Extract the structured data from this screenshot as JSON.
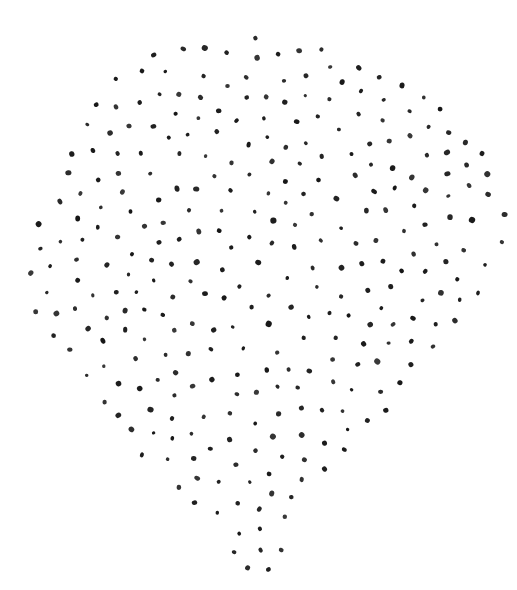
{
  "figure": {
    "background_color": "#ffffff",
    "dot_color": "#161616",
    "canvas": {
      "width": 517,
      "height": 590
    },
    "stipple": {
      "seed": 911,
      "min_spacing": 19,
      "dot_radius_min": 1.8,
      "dot_radius_max": 2.7,
      "edge_margin": 3,
      "max_attempts": 40000,
      "max_dots": 420,
      "dot_opacity_min": 0.86,
      "dot_opacity_max": 1.0,
      "blur_std_dev": 0.4
    },
    "outline": [
      [
        245,
        32
      ],
      [
        278,
        35
      ],
      [
        308,
        42
      ],
      [
        332,
        48
      ],
      [
        354,
        56
      ],
      [
        374,
        66
      ],
      [
        394,
        77
      ],
      [
        414,
        87
      ],
      [
        434,
        99
      ],
      [
        452,
        111
      ],
      [
        466,
        125
      ],
      [
        479,
        141
      ],
      [
        491,
        159
      ],
      [
        501,
        181
      ],
      [
        508,
        206
      ],
      [
        511,
        233
      ],
      [
        507,
        259
      ],
      [
        497,
        282
      ],
      [
        483,
        306
      ],
      [
        467,
        329
      ],
      [
        449,
        349
      ],
      [
        429,
        369
      ],
      [
        409,
        389
      ],
      [
        391,
        409
      ],
      [
        375,
        429
      ],
      [
        357,
        445
      ],
      [
        341,
        456
      ],
      [
        329,
        471
      ],
      [
        317,
        489
      ],
      [
        305,
        506
      ],
      [
        297,
        526
      ],
      [
        289,
        546
      ],
      [
        279,
        563
      ],
      [
        267,
        579
      ],
      [
        255,
        587
      ],
      [
        245,
        580
      ],
      [
        237,
        566
      ],
      [
        227,
        549
      ],
      [
        214,
        533
      ],
      [
        199,
        519
      ],
      [
        183,
        503
      ],
      [
        165,
        485
      ],
      [
        147,
        467
      ],
      [
        129,
        449
      ],
      [
        111,
        429
      ],
      [
        95,
        411
      ],
      [
        79,
        391
      ],
      [
        63,
        369
      ],
      [
        49,
        346
      ],
      [
        37,
        323
      ],
      [
        28,
        301
      ],
      [
        25,
        279
      ],
      [
        27,
        256
      ],
      [
        32,
        233
      ],
      [
        39,
        209
      ],
      [
        49,
        183
      ],
      [
        61,
        158
      ],
      [
        70,
        133
      ],
      [
        82,
        110
      ],
      [
        96,
        88
      ],
      [
        112,
        73
      ],
      [
        130,
        62
      ],
      [
        152,
        51
      ],
      [
        182,
        43
      ],
      [
        214,
        36
      ]
    ]
  }
}
